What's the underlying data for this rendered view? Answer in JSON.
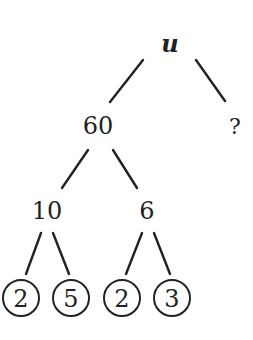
{
  "diagram": {
    "type": "factor-tree",
    "root": {
      "label": "u"
    },
    "level1": [
      {
        "label": "60"
      },
      {
        "label": "?"
      }
    ],
    "level2": [
      {
        "label": "10"
      },
      {
        "label": "6"
      }
    ],
    "leaves": [
      {
        "label": "2",
        "circled": true
      },
      {
        "label": "5",
        "circled": true
      },
      {
        "label": "2",
        "circled": true
      },
      {
        "label": "3",
        "circled": true
      }
    ],
    "colors": {
      "ink": "#222222",
      "background": "#ffffff"
    }
  }
}
